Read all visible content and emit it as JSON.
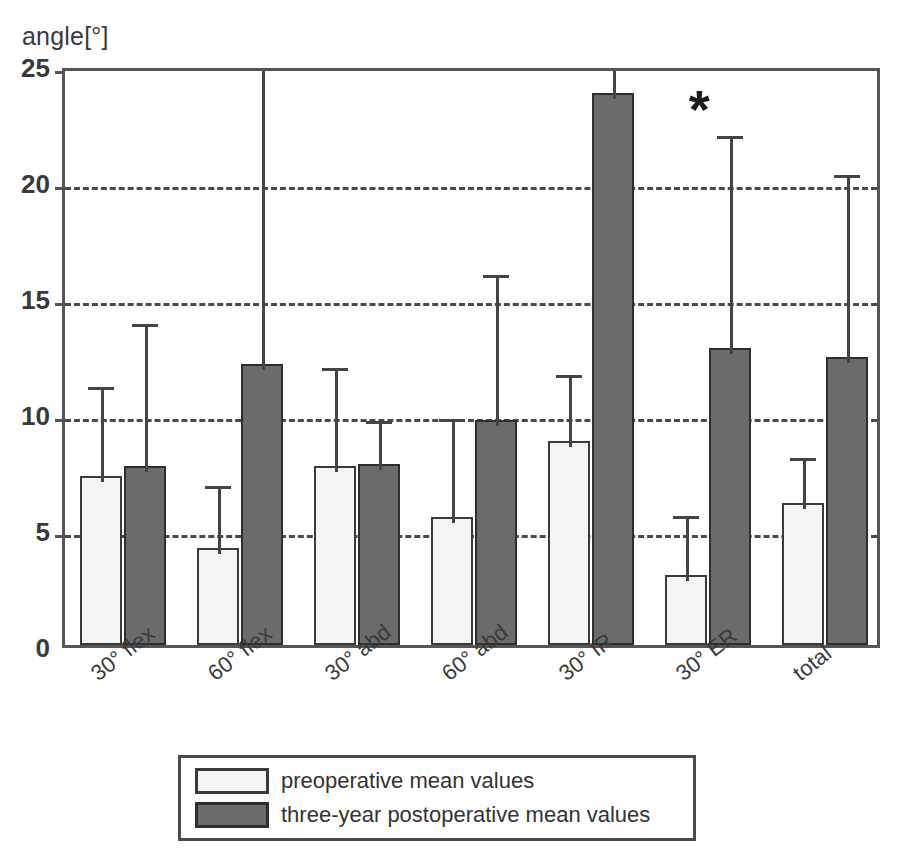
{
  "chart_data": {
    "type": "bar",
    "title": "",
    "subtitle": "",
    "xlabel": "",
    "ylabel": "angle[°]",
    "ylim": [
      0,
      25
    ],
    "yticks": [
      0,
      5,
      10,
      15,
      20,
      25
    ],
    "grid": "horizontal dashed at 5, 10, 15, 20, 25",
    "legend_position": "below plot, centered",
    "categories": [
      "30° flex",
      "60° flex",
      "30° abd",
      "60° abd",
      "30° IR",
      "30° ER",
      "total"
    ],
    "series": [
      {
        "name": "preoperative mean values",
        "color": "#f4f4f4",
        "values": [
          7.3,
          4.2,
          7.7,
          5.5,
          8.8,
          3.0,
          6.1
        ],
        "error_upper": [
          11.4,
          7.1,
          12.2,
          10.0,
          11.9,
          5.8,
          8.3
        ]
      },
      {
        "name": "three-year postoperative mean values",
        "color": "#6b6b6b",
        "values": [
          7.7,
          12.1,
          7.8,
          9.7,
          23.8,
          12.8,
          12.4
        ],
        "error_upper": [
          14.1,
          25.0,
          9.9,
          16.2,
          25.0,
          22.2,
          20.5
        ]
      }
    ],
    "annotations": [
      {
        "text": "*",
        "category": "30° ER",
        "note": "significance marker above 30° ER group"
      }
    ]
  },
  "legend": {
    "items": [
      {
        "label": "preoperative mean values",
        "swatch": "light-swatch"
      },
      {
        "label": "three-year postoperative mean values",
        "swatch": "dark-swatch"
      }
    ]
  },
  "axis": {
    "y_caption": "angle[°]",
    "y_tick_labels": [
      "25",
      "20",
      "15",
      "10",
      "5",
      "0"
    ]
  }
}
